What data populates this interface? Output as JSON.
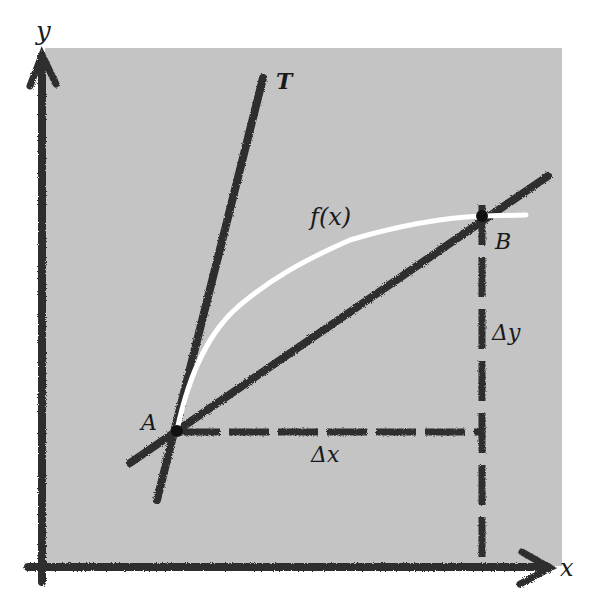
{
  "diagram": {
    "colors": {
      "background": "#ffffff",
      "panel": "#c4c4c4",
      "ink": "#2a2a2a",
      "curve": "#ffffff"
    },
    "axes": {
      "x_label": "x",
      "y_label": "y"
    },
    "labels": {
      "tangent": "T",
      "function": "f(x)",
      "point_a": "A",
      "point_b": "B",
      "delta_x": "Δx",
      "delta_y": "Δy"
    },
    "points": {
      "A": [
        177,
        431
      ],
      "B": [
        482,
        216
      ]
    },
    "lines": {
      "tangent": {
        "from": [
          157,
          500
        ],
        "to": [
          263,
          78
        ]
      },
      "secant": {
        "from": [
          130,
          463
        ],
        "to": [
          548,
          176
        ]
      }
    }
  }
}
